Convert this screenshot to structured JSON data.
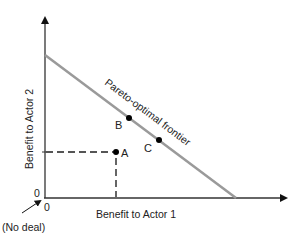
{
  "diagram": {
    "type": "pareto-frontier",
    "x_axis_label": "Benefit to Actor 1",
    "y_axis_label": "Benefit to Actor 2",
    "x_origin_label": "0",
    "y_origin_label": "0",
    "frontier_label": "Pareto-optimal frontier",
    "no_deal_label": "(No deal)",
    "points": [
      {
        "label": "A",
        "on_frontier": false
      },
      {
        "label": "B",
        "on_frontier": true
      },
      {
        "label": "C",
        "on_frontier": true
      }
    ],
    "colors": {
      "axes": "#333333",
      "frontier": "#9a9a9a",
      "points": "#111111",
      "dashed": "#555555"
    }
  }
}
